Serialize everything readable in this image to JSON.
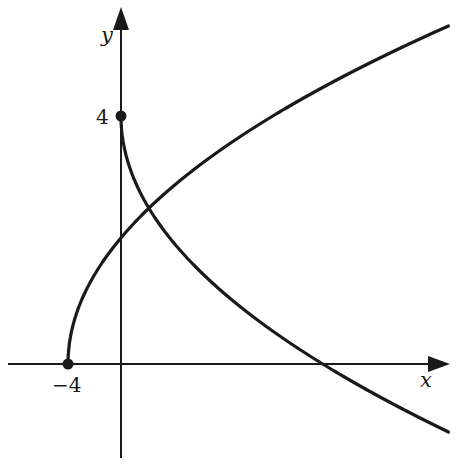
{
  "diagram": {
    "axes": {
      "x_label": "x",
      "y_label": "y",
      "x_tick_label": "−4",
      "y_tick_label": "4"
    },
    "points": [
      {
        "name": "y-intercept-point",
        "x": 0,
        "y": 4,
        "label": "4"
      },
      {
        "name": "x-intercept-point",
        "x": -4,
        "y": 0,
        "label": "−4"
      }
    ],
    "curves": [
      {
        "name": "rising-curve",
        "equation": "x = y^2 - 4 (upper branch)",
        "start": [
          -4,
          0
        ]
      },
      {
        "name": "descending-curve",
        "equation": "x = (y - 4)^2 (lower branch)",
        "start": [
          0,
          4
        ]
      }
    ],
    "colors": {
      "stroke": "#1a1a1a",
      "background": "#ffffff"
    }
  }
}
